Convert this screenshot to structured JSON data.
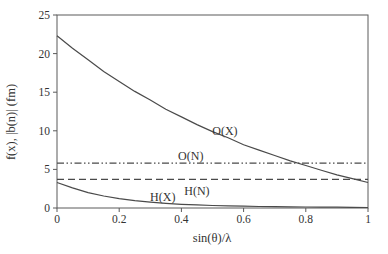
{
  "figure": {
    "background": "#ffffff",
    "line_color": "#4a4a4a",
    "axis_color": "#5a5a5a",
    "text_color": "#333333"
  },
  "chart_data": {
    "type": "line",
    "title": "",
    "xlabel": "sin(θ)/λ",
    "ylabel": "f(x), |b(n)| (fm)",
    "xlim": [
      0,
      1
    ],
    "ylim": [
      0,
      25
    ],
    "xticks": [
      0,
      0.2,
      0.4,
      0.6,
      0.8,
      1
    ],
    "xtick_labels": [
      "0",
      "0.2",
      "0.4",
      "0.6",
      "0.8",
      "1"
    ],
    "yticks": [
      0,
      5,
      10,
      15,
      20,
      25
    ],
    "ytick_labels": [
      "0",
      "5",
      "10",
      "15",
      "20",
      "25"
    ],
    "grid": false,
    "legend": "none",
    "x": [
      0,
      0.05,
      0.1,
      0.15,
      0.2,
      0.25,
      0.3,
      0.35,
      0.4,
      0.45,
      0.5,
      0.55,
      0.6,
      0.65,
      0.7,
      0.75,
      0.8,
      0.85,
      0.9,
      0.95,
      1
    ],
    "series": [
      {
        "id": "curve-o-x",
        "name": "O(X)",
        "style": "solid",
        "values": [
          22.3,
          20.7,
          19.2,
          17.7,
          16.4,
          15.1,
          14.0,
          12.8,
          11.8,
          10.8,
          9.9,
          9.1,
          8.2,
          7.5,
          6.8,
          6.1,
          5.5,
          4.9,
          4.3,
          3.8,
          3.3
        ]
      },
      {
        "id": "line-o-n",
        "name": "O(N)",
        "style": "dashdotdot",
        "constant": 5.8
      },
      {
        "id": "line-h-n",
        "name": "H(N)",
        "style": "dashed",
        "constant": 3.7
      },
      {
        "id": "curve-h-x",
        "name": "H(X)",
        "style": "solid",
        "values": [
          3.3,
          2.6,
          2.0,
          1.55,
          1.2,
          0.95,
          0.75,
          0.6,
          0.48,
          0.4,
          0.33,
          0.28,
          0.23,
          0.2,
          0.17,
          0.15,
          0.13,
          0.11,
          0.1,
          0.08,
          0.07
        ]
      }
    ],
    "annotations": [
      {
        "id": "curve-label-o-x",
        "text": "O(X)",
        "x": 0.54,
        "y": 10.0
      },
      {
        "id": "curve-label-o-n",
        "text": "O(N)",
        "x": 0.43,
        "y": 6.7
      },
      {
        "id": "curve-label-h-n",
        "text": "H(N)",
        "x": 0.45,
        "y": 2.2
      },
      {
        "id": "curve-label-h-x",
        "text": "H(X)",
        "x": 0.34,
        "y": 1.4
      }
    ]
  }
}
